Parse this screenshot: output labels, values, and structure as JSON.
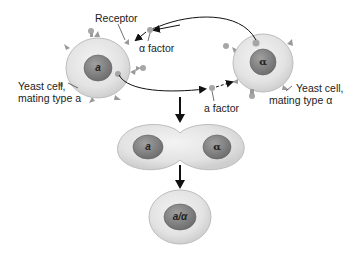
{
  "diagram": {
    "labels": {
      "receptor": "Receptor",
      "alpha_factor": "α factor",
      "a_factor": "a factor",
      "cell_a_line1": "Yeast cell,",
      "cell_a_line2": "mating type a",
      "cell_alpha_line1": "Yeast cell,",
      "cell_alpha_line2": "mating type α"
    },
    "nuclei": {
      "cell_a": "a",
      "cell_alpha": "α",
      "fusion_left": "a",
      "fusion_right": "α",
      "diploid": "a/α"
    },
    "colors": {
      "cell_fill": "#e6e6e6",
      "cell_edge": "#b8b8b8",
      "nucleus_fill": "#8a8a8a",
      "nucleus_edge": "#5e5e5e",
      "receptor": "#9a9a9a",
      "factor": "#a6a6a6",
      "arrow": "#111111"
    }
  }
}
